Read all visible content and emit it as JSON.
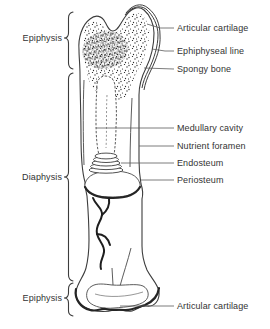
{
  "diagram": {
    "type": "anatomical-diagram",
    "region_labels": {
      "proximal_epiphysis": "Epiphysis",
      "diaphysis": "Diaphysis",
      "distal_epiphysis": "Epiphysis"
    },
    "part_labels": {
      "articular_cartilage_top": "Articular cartilage",
      "epiphyseal_line": "Ephiphyseal line",
      "spongy_bone": "Spongy bone",
      "medullary_cavity": "Medullary cavity",
      "nutrient_foramen": "Nutrient foramen",
      "endosteum": "Endosteum",
      "periosteum": "Periosteum",
      "articular_cartilage_bottom": "Articular cartilage"
    },
    "colors": {
      "background": "#ffffff",
      "line": "#3d3d3d",
      "text": "#333333"
    }
  }
}
